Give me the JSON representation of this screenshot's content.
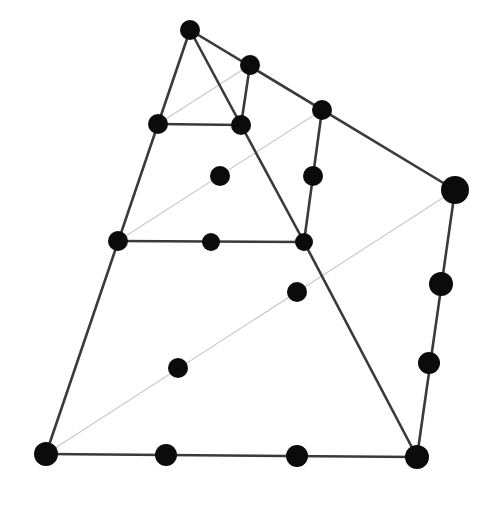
{
  "diagram": {
    "type": "tetrahedral-element-node-layout",
    "background": "#ffffff",
    "colors": {
      "solid_edge": "#3a3a3a",
      "hidden_edge": "#c8c8c8",
      "node": "#0b0b0b"
    },
    "nodes": [
      {
        "id": "n1",
        "x": 190,
        "y": 30,
        "r": 10
      },
      {
        "id": "n2",
        "x": 250,
        "y": 65,
        "r": 10
      },
      {
        "id": "n3",
        "x": 322,
        "y": 110,
        "r": 10
      },
      {
        "id": "n4",
        "x": 455,
        "y": 190,
        "r": 14
      },
      {
        "id": "n5",
        "x": 158,
        "y": 124,
        "r": 10
      },
      {
        "id": "n6",
        "x": 241,
        "y": 125,
        "r": 10
      },
      {
        "id": "n7",
        "x": 220,
        "y": 176,
        "r": 10
      },
      {
        "id": "n8",
        "x": 313,
        "y": 176,
        "r": 10
      },
      {
        "id": "n9",
        "x": 118,
        "y": 241,
        "r": 10
      },
      {
        "id": "n10",
        "x": 211,
        "y": 242,
        "r": 9
      },
      {
        "id": "n11",
        "x": 304,
        "y": 242,
        "r": 9
      },
      {
        "id": "n12",
        "x": 297,
        "y": 292,
        "r": 10
      },
      {
        "id": "n13",
        "x": 178,
        "y": 368,
        "r": 10
      },
      {
        "id": "n14",
        "x": 441,
        "y": 284,
        "r": 12
      },
      {
        "id": "n15",
        "x": 429,
        "y": 363,
        "r": 11
      },
      {
        "id": "n16",
        "x": 46,
        "y": 454,
        "r": 12
      },
      {
        "id": "n17",
        "x": 166,
        "y": 455,
        "r": 11
      },
      {
        "id": "n18",
        "x": 297,
        "y": 456,
        "r": 11
      },
      {
        "id": "n19",
        "x": 417,
        "y": 457,
        "r": 12
      }
    ],
    "solid_edges": [
      {
        "x1": 190,
        "y1": 30,
        "x2": 46,
        "y2": 454
      },
      {
        "x1": 190,
        "y1": 30,
        "x2": 455,
        "y2": 190
      },
      {
        "x1": 190,
        "y1": 30,
        "x2": 241,
        "y2": 125
      },
      {
        "x1": 241,
        "y1": 125,
        "x2": 304,
        "y2": 242
      },
      {
        "x1": 304,
        "y1": 242,
        "x2": 417,
        "y2": 457
      },
      {
        "x1": 250,
        "y1": 65,
        "x2": 241,
        "y2": 125
      },
      {
        "x1": 322,
        "y1": 110,
        "x2": 304,
        "y2": 242
      },
      {
        "x1": 158,
        "y1": 124,
        "x2": 241,
        "y2": 125
      },
      {
        "x1": 118,
        "y1": 241,
        "x2": 304,
        "y2": 242
      },
      {
        "x1": 46,
        "y1": 454,
        "x2": 417,
        "y2": 457
      },
      {
        "x1": 455,
        "y1": 190,
        "x2": 417,
        "y2": 457
      }
    ],
    "hidden_edges": [
      {
        "x1": 46,
        "y1": 454,
        "x2": 455,
        "y2": 190
      },
      {
        "x1": 118,
        "y1": 241,
        "x2": 322,
        "y2": 110
      },
      {
        "x1": 158,
        "y1": 124,
        "x2": 250,
        "y2": 65
      }
    ]
  }
}
